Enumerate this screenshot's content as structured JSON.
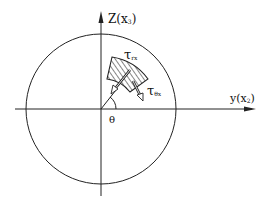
{
  "diagram": {
    "axis_vertical": {
      "label": "Z(x",
      "sub": "3",
      "close": ")"
    },
    "axis_horizontal": {
      "label": "y(x",
      "sub": "2",
      "close": ")"
    },
    "angle_label": "θ",
    "stress_label_1": {
      "main": "τ",
      "sub": "rx"
    },
    "stress_label_2": {
      "main": "τ",
      "sub": "θx"
    },
    "colors": {
      "line": "#222222",
      "background": "#ffffff"
    }
  }
}
